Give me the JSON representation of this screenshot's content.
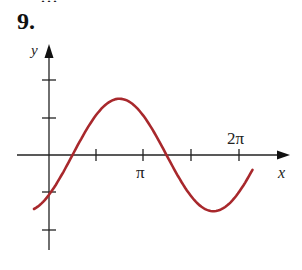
{
  "problem": {
    "number": "9.",
    "partial_text_above": "…graph…"
  },
  "chart_data": {
    "type": "line",
    "title": "",
    "xlabel": "x",
    "ylabel": "y",
    "x_tick_labels": [
      {
        "value": 3.1416,
        "label": "π"
      },
      {
        "value": 6.2832,
        "label": "2π"
      }
    ],
    "x_ticks": [
      1.5708,
      3.1416,
      4.7124,
      6.2832
    ],
    "y_ticks": [
      -2,
      -1,
      1,
      2
    ],
    "xlim": [
      -0.5,
      7.8
    ],
    "ylim": [
      -2.6,
      3.0
    ],
    "grid": false,
    "legend": null,
    "series": [
      {
        "name": "curve",
        "color": "#a8282c",
        "description": "sinusoid approx y = 1.5 sin(x - π/4)",
        "x": [
          -0.5,
          0,
          0.785,
          1.571,
          2.356,
          3.142,
          3.927,
          4.712,
          5.498,
          6.283,
          6.8
        ],
        "y": [
          -1.43,
          -1.06,
          0,
          1.06,
          1.5,
          1.06,
          0,
          -1.06,
          -1.5,
          -1.06,
          -0.6
        ]
      }
    ]
  },
  "colors": {
    "curve": "#a8282c",
    "axis": "#222222"
  }
}
